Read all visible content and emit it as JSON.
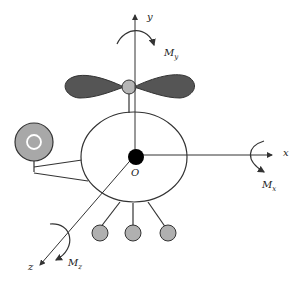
{
  "diagram": {
    "type": "coordinate-system illustration",
    "colors": {
      "line": "#333333",
      "blade_fill": "#555555",
      "hub_fill": "#b5b5b5",
      "sensor_fill": "#a8a8a8",
      "sensor_ring": "#ffffff",
      "foot_fill": "#b0b0b0",
      "origin_fill": "#000000",
      "background": "#ffffff"
    },
    "axes": {
      "x": {
        "label": "x",
        "moment_label": "M",
        "moment_sub": "x"
      },
      "y": {
        "label": "y",
        "moment_label": "M",
        "moment_sub": "y"
      },
      "z": {
        "label": "z",
        "moment_label": "M",
        "moment_sub": "z"
      }
    },
    "origin_label": "O",
    "caption": ""
  }
}
